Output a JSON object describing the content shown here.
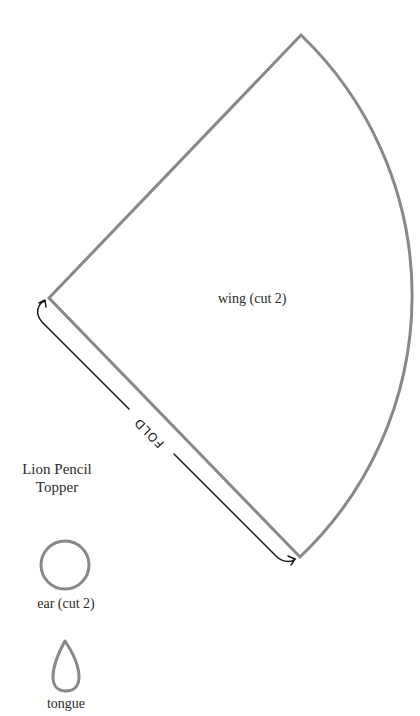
{
  "pattern": {
    "title_line1": "Lion Pencil",
    "title_line2": "Topper",
    "pieces": [
      {
        "name": "wing",
        "label": "wing (cut 2)"
      },
      {
        "name": "ear",
        "label": "ear (cut 2)"
      },
      {
        "name": "tongue",
        "label": "tongue"
      }
    ],
    "fold_label": "FOLD"
  },
  "colors": {
    "outline": "#888888",
    "arrow": "#1a1a1a",
    "text": "#2b2b2b",
    "background": "#ffffff"
  }
}
